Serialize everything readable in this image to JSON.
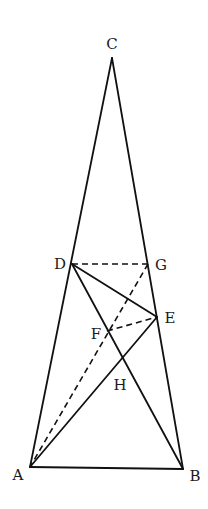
{
  "figure": {
    "type": "geometric-construction",
    "points": {
      "C": {
        "x": 112,
        "y": 58,
        "label": "C",
        "lx": 112,
        "ly": 49
      },
      "D": {
        "x": 72,
        "y": 264,
        "label": "D",
        "lx": 60,
        "ly": 269
      },
      "G": {
        "x": 148,
        "y": 264,
        "label": "G",
        "lx": 161,
        "ly": 270
      },
      "E": {
        "x": 157,
        "y": 317,
        "label": "E",
        "lx": 170,
        "ly": 323
      },
      "F": {
        "x": 107,
        "y": 331,
        "label": "F",
        "lx": 96,
        "ly": 339
      },
      "H": {
        "x": 122,
        "y": 360,
        "label": "H",
        "lx": 120,
        "ly": 390
      },
      "A": {
        "x": 30,
        "y": 467,
        "label": "A",
        "lx": 18,
        "ly": 480
      },
      "B": {
        "x": 183,
        "y": 469,
        "label": "B",
        "lx": 195,
        "ly": 481
      }
    },
    "solid_segments": [
      [
        "C",
        "A"
      ],
      [
        "C",
        "B"
      ],
      [
        "A",
        "B"
      ],
      [
        "D",
        "E"
      ],
      [
        "D",
        "B"
      ],
      [
        "A",
        "E"
      ]
    ],
    "dashed_segments": [
      [
        "D",
        "G"
      ],
      [
        "G",
        "A"
      ],
      [
        "F",
        "E"
      ]
    ],
    "labels": [
      "A",
      "B",
      "C",
      "D",
      "E",
      "F",
      "G",
      "H"
    ]
  }
}
